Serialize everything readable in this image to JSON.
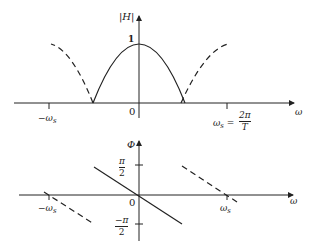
{
  "magnitude_plot": {
    "y_axis_label": "|H|",
    "x_axis_label": "ω",
    "peak_label": "1",
    "origin_label": "0",
    "left_tick_label": "−ω",
    "left_tick_sub": "s",
    "right_tick_label": "ω",
    "right_tick_sub": "s",
    "right_tick_eq": "=",
    "right_tick_num": "2π",
    "right_tick_den": "T",
    "solid_segment": "main lobe between −ωs/2 and ωs/2",
    "dashed_segments": "periodic repetition beyond ±ωs/2"
  },
  "phase_plot": {
    "y_axis_label": "Φ",
    "x_axis_label": "ω",
    "origin_label": "0",
    "pos_tick_num": "π",
    "pos_tick_den": "2",
    "neg_tick_num": "−π",
    "neg_tick_den": "2",
    "left_tick_label": "−ω",
    "left_tick_sub": "s",
    "right_tick_label": "ω",
    "right_tick_sub": "s",
    "solid_segment": "linear phase from π/2 to −π/2",
    "dashed_segments": "periodic repetition"
  },
  "colors": {
    "ink": "#222222",
    "background": "#ffffff"
  }
}
